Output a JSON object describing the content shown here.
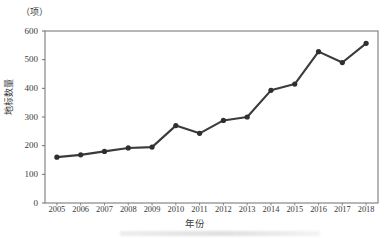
{
  "chart_data": {
    "type": "line",
    "title": "",
    "subtitle": "",
    "unit_note": "（项）",
    "xlabel": "年份",
    "ylabel": "地标数量",
    "categories": [
      "2005",
      "2006",
      "2007",
      "2008",
      "2009",
      "2010",
      "2011",
      "2012",
      "2013",
      "2014",
      "2015",
      "2016",
      "2017",
      "2018"
    ],
    "values": [
      160,
      168,
      180,
      192,
      195,
      270,
      243,
      288,
      300,
      393,
      415,
      528,
      490,
      557
    ],
    "series": [
      {
        "name": "地标数量",
        "values": [
          160,
          168,
          180,
          192,
          195,
          270,
          243,
          288,
          300,
          393,
          415,
          528,
          490,
          557
        ]
      }
    ],
    "yticks": [
      0,
      100,
      200,
      300,
      400,
      500,
      600
    ],
    "ytick_labels": [
      "0",
      "100",
      "200",
      "300",
      "400",
      "500",
      "600"
    ],
    "ylim": [
      0,
      600
    ],
    "xlim": [
      "2005",
      "2018"
    ],
    "grid": false,
    "legend": false,
    "legend_position": "none",
    "marker": "circle",
    "line_color": "#3b3b3b",
    "marker_color": "#2f2f2f",
    "axis_color": "#6f6f6f",
    "background_color": "#ffffff",
    "annotations": []
  }
}
